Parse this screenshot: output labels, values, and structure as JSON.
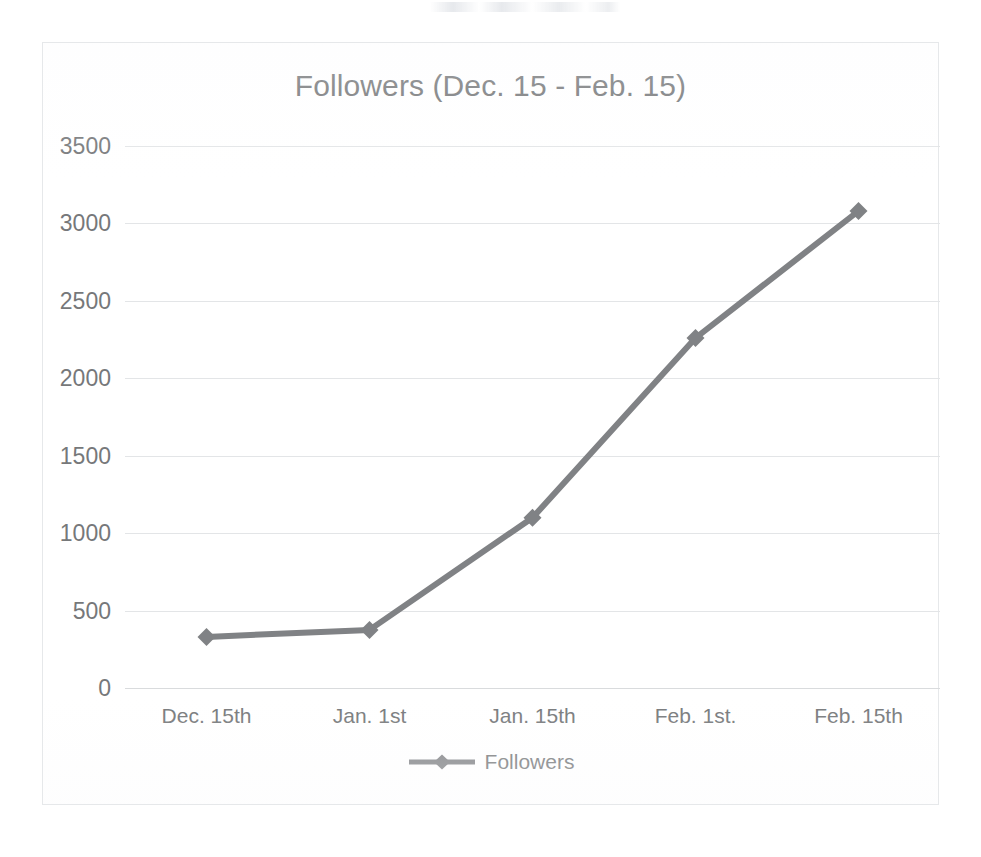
{
  "chart_data": {
    "type": "line",
    "title": "Followers (Dec. 15 - Feb. 15)",
    "xlabel": "",
    "ylabel": "",
    "categories": [
      "Dec. 15th",
      "Jan. 1st",
      "Jan. 15th",
      "Feb. 1st.",
      "Feb. 15th"
    ],
    "series": [
      {
        "name": "Followers",
        "values": [
          330,
          375,
          1100,
          2260,
          3080
        ]
      }
    ],
    "ylim": [
      0,
      3500
    ],
    "yticks": [
      0,
      500,
      1000,
      1500,
      2000,
      2500,
      3000,
      3500
    ],
    "ytick_labels": [
      "0",
      "500",
      "1000",
      "1500",
      "2000",
      "2500",
      "3000",
      "3500"
    ],
    "grid": true,
    "legend": {
      "position": "bottom",
      "entries": [
        "Followers"
      ]
    },
    "colors": {
      "series": "#808285",
      "gridline": "#e3e5e7",
      "text": "#76787a",
      "title": "#6d6f71",
      "frame": "#e6e8ea",
      "background": "#ffffff"
    },
    "marker": "diamond"
  },
  "chart": {
    "title": "Followers (Dec. 15 - Feb. 15)",
    "legend_label": "Followers"
  }
}
